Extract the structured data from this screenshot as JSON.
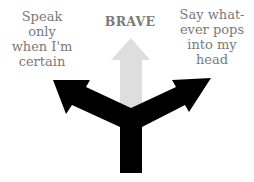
{
  "diagram": {
    "labels": {
      "left": "Speak only when I'm certain",
      "center": "BRAVE",
      "right": "Say what-ever pops into my head"
    },
    "label_lines": {
      "left": [
        "Speak",
        "only",
        "when I'm",
        "certain"
      ],
      "center": [
        "BRAVE"
      ],
      "right": [
        "Say what-",
        "ever pops",
        "into my",
        "head"
      ]
    },
    "colors": {
      "text": "#7a7a7a",
      "black_arrows": "#000000",
      "center_arrow": "#dedede",
      "background": "#ffffff"
    }
  }
}
